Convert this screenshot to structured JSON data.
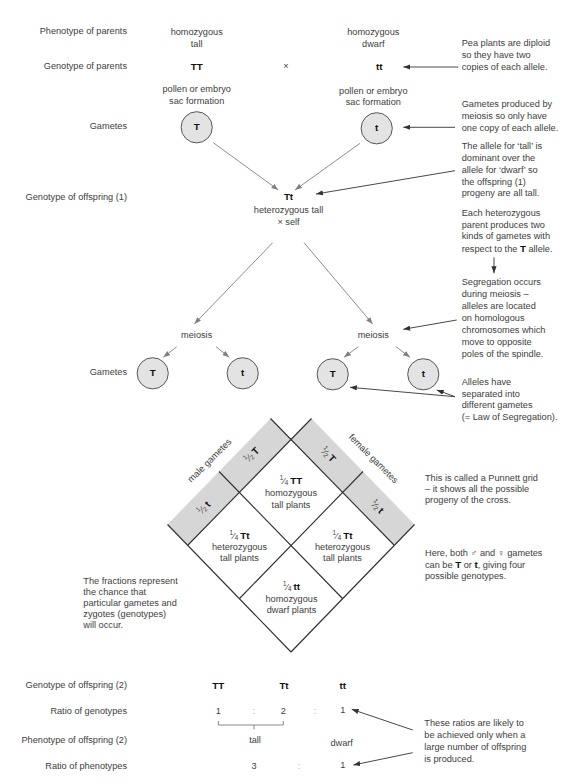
{
  "colors": {
    "text": "#3d3d3d",
    "bold_text": "#111111",
    "band_fill": "#d6d6d6",
    "circle_fill": "#e3e3e3",
    "circle_stroke": "#555555",
    "grid_line": "#2e2e2e",
    "flow_arrow": "#808080",
    "annotation_arrow": "#333333",
    "ratio_colon": "#b0b0b0",
    "bracket": "#7a7a7a",
    "background": "#ffffff"
  },
  "fraction_bar": "⁄",
  "row_labels": {
    "phenotype_parents": "Phenotype of parents",
    "genotype_parents": "Genotype of parents",
    "gametes_1": "Gametes",
    "genotype_offspring_1": "Genotype of offspring (1)",
    "gametes_2": "Gametes",
    "genotype_offspring_2": "Genotype of offspring (2)",
    "ratio_genotypes": "Ratio of genotypes",
    "phenotype_offspring_2": "Phenotype of offspring (2)",
    "ratio_phenotypes": "Ratio of phenotypes"
  },
  "parents": {
    "tall": {
      "phenotype_line1": "homozygous",
      "phenotype_line2": "tall",
      "genotype": "TT",
      "formation_line1": "pollen or embryo",
      "formation_line2": "sac formation",
      "gamete": "T"
    },
    "cross_symbol": "×",
    "dwarf": {
      "phenotype_line1": "homozygous",
      "phenotype_line2": "dwarf",
      "genotype": "tt",
      "formation_line1": "pollen or embryo",
      "formation_line2": "sac formation",
      "gamete": "t"
    }
  },
  "offspring_1": {
    "genotype": "Tt",
    "phenotype": "heterozygous tall",
    "cross": "× self"
  },
  "meiosis": [
    {
      "label": "meiosis",
      "gametes": [
        "T",
        "t"
      ]
    },
    {
      "label": "meiosis",
      "gametes": [
        "T",
        "t"
      ]
    }
  ],
  "punnett": {
    "male_label": "male gametes",
    "female_label": "female gametes",
    "male_gametes": [
      {
        "num": "1",
        "den": "2",
        "allele": "T"
      },
      {
        "num": "1",
        "den": "2",
        "allele": "t"
      }
    ],
    "female_gametes": [
      {
        "num": "1",
        "den": "2",
        "allele": "T"
      },
      {
        "num": "1",
        "den": "2",
        "allele": "t"
      }
    ],
    "cells": [
      {
        "position": "top",
        "num": "1",
        "den": "4",
        "genotype": "TT",
        "line1": "homozygous",
        "line2": "tall plants"
      },
      {
        "position": "left",
        "num": "1",
        "den": "4",
        "genotype": "Tt",
        "line1": "heterozygous",
        "line2": "tall plants"
      },
      {
        "position": "right",
        "num": "1",
        "den": "4",
        "genotype": "Tt",
        "line1": "heterozygous",
        "line2": "tall plants"
      },
      {
        "position": "bottom",
        "num": "1",
        "den": "4",
        "genotype": "tt",
        "line1": "homozygous",
        "line2": "dwarf plants"
      }
    ]
  },
  "annotations": {
    "diploid": [
      "Pea plants are diploid",
      "so they have two",
      "copies of each allele."
    ],
    "gametes_meiosis": [
      "Gametes produced by",
      "meiosis so only have",
      "one copy of each allele."
    ],
    "dominance": [
      "The allele for ‘tall’ is",
      "dominant over the",
      "allele for ‘dwarf’ so",
      "the offspring (1)",
      "progeny are all tall."
    ],
    "heterozygous_parent": {
      "lines": [
        "Each heterozygous",
        "parent produces two",
        "kinds of gametes with"
      ],
      "last_pre": "respect to the ",
      "last_bold": "T",
      "last_post": " allele."
    },
    "segregation": [
      "Segregation occurs",
      "during meiosis –",
      "alleles are located",
      "on homologous",
      "chromosomes which",
      "move to opposite",
      "poles of the spindle."
    ],
    "law_of_segregation": [
      "Alleles have",
      "separated into",
      "different gametes",
      "(= Law of Segregation)."
    ],
    "punnett_grid": [
      "This is called a Punnett grid",
      "– it shows all the possible",
      "progeny of the cross."
    ],
    "possible_genotypes": {
      "line1_pre": "Here, both ",
      "male_symbol": "♂",
      "line1_mid": " and ",
      "female_symbol": "♀",
      "line1_post": " gametes",
      "line2_pre": "can be ",
      "line2_bold1": "T",
      "line2_mid": " or ",
      "line2_bold2": "t",
      "line2_post": ", giving four",
      "line3": "possible genotypes."
    },
    "fractions": [
      "The fractions represent",
      "the chance that",
      "particular gametes and",
      "zygotes (genotypes)",
      "will occur."
    ],
    "large_numbers": [
      "These ratios are likely to",
      "be achieved only when a",
      "large number of offspring",
      "is produced."
    ]
  },
  "results": {
    "genotypes": [
      "TT",
      "Tt",
      "tt"
    ],
    "genotype_ratio": {
      "values": [
        "1",
        "2",
        "1"
      ],
      "separator": ":"
    },
    "phenotypes": [
      "tall",
      "dwarf"
    ],
    "phenotype_ratio": {
      "values": [
        "3",
        "1"
      ],
      "separator": ":"
    }
  }
}
